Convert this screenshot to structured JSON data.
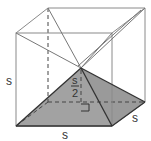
{
  "diagram": {
    "labels": {
      "left_edge": "s",
      "bottom_edge": "s",
      "right_edge": "s",
      "height_num": "s",
      "height_den": "2"
    },
    "colors": {
      "edge": "#8a8a8a",
      "pyramid_edge": "#333333",
      "pyramid_fill": "#9a9a9a",
      "dashed": "#444444"
    }
  }
}
